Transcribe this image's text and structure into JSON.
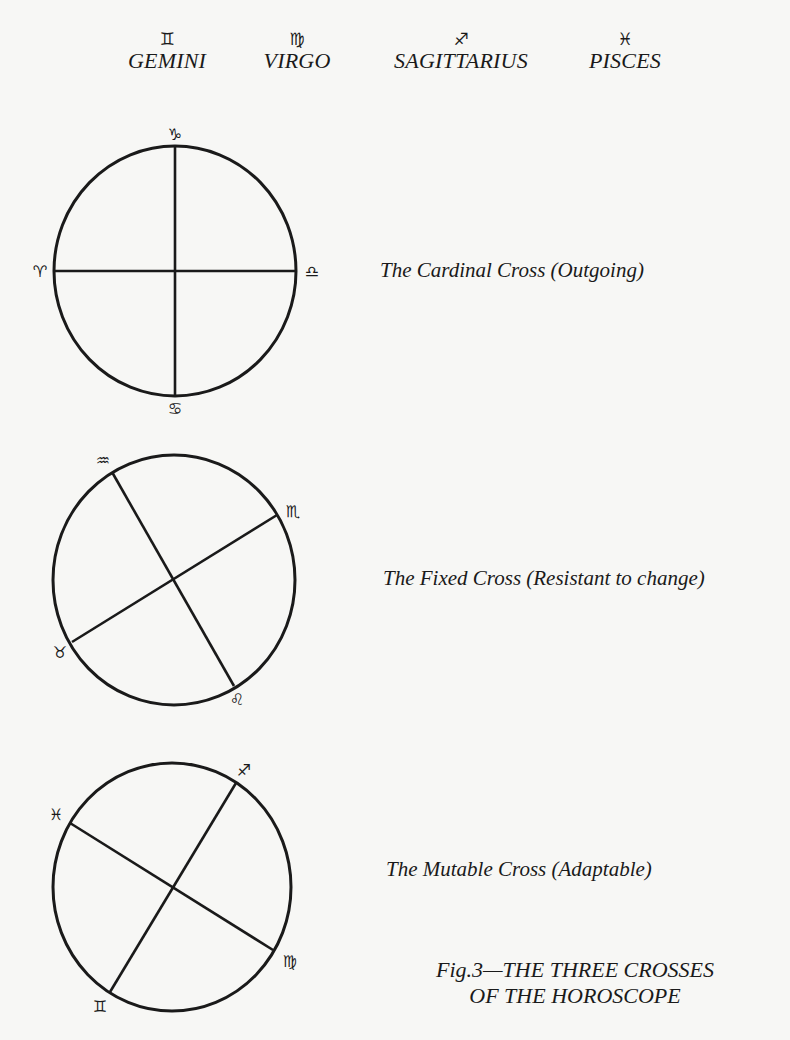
{
  "header_signs": [
    {
      "glyph": "♊",
      "name": "GEMINI",
      "icon": "gemini-icon"
    },
    {
      "glyph": "♍",
      "name": "VIRGO",
      "icon": "virgo-icon"
    },
    {
      "glyph": "♐",
      "name": "SAGITTARIUS",
      "icon": "sagittarius-icon"
    },
    {
      "glyph": "♓",
      "name": "PISCES",
      "icon": "pisces-icon"
    }
  ],
  "crosses": [
    {
      "name": "cardinal",
      "caption": "The Cardinal Cross (Outgoing)",
      "signs": {
        "top": {
          "glyph": "♑",
          "name": "capricorn"
        },
        "left": {
          "glyph": "♈",
          "name": "aries"
        },
        "right": {
          "glyph": "♎",
          "name": "libra"
        },
        "bottom": {
          "glyph": "♋",
          "name": "cancer"
        }
      }
    },
    {
      "name": "fixed",
      "caption": "The Fixed Cross (Resistant to change)",
      "signs": {
        "upper_left": {
          "glyph": "♒",
          "name": "aquarius"
        },
        "upper_right": {
          "glyph": "♏",
          "name": "scorpio"
        },
        "lower_left": {
          "glyph": "♉",
          "name": "taurus"
        },
        "lower_right": {
          "glyph": "♌",
          "name": "leo"
        }
      }
    },
    {
      "name": "mutable",
      "caption": "The Mutable Cross (Adaptable)",
      "signs": {
        "upper_left": {
          "glyph": "♓",
          "name": "pisces"
        },
        "upper_right": {
          "glyph": "♐",
          "name": "sagittarius"
        },
        "lower_left": {
          "glyph": "♊",
          "name": "gemini"
        },
        "lower_right": {
          "glyph": "♍",
          "name": "virgo"
        }
      }
    }
  ],
  "figure_caption": {
    "line1": "Fig.3—THE THREE CROSSES",
    "line2": "OF THE HOROSCOPE"
  }
}
